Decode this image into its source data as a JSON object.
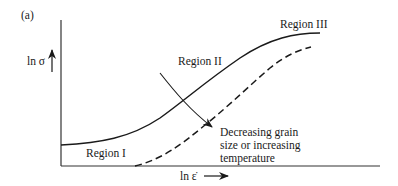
{
  "figure": {
    "panel_label": "(a)",
    "y_axis_label": "ln σ",
    "x_axis_label": "ln ε̇",
    "regions": [
      {
        "label": "Region I"
      },
      {
        "label": "Region II"
      },
      {
        "label": "Region III"
      }
    ],
    "annotation": {
      "lines": [
        "Decreasing grain",
        "size or increasing",
        "temperature"
      ]
    },
    "curves": [
      {
        "name": "reference",
        "style": "solid"
      },
      {
        "name": "shifted",
        "style": "dashed"
      }
    ],
    "colors": {
      "ink": "#1a1a1a",
      "background": "#ffffff"
    }
  }
}
